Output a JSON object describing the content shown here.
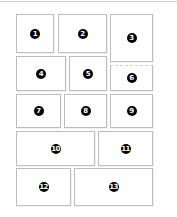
{
  "diagram": {
    "type": "numbered-grid-layout",
    "colors": {
      "border": "#bdbdbd",
      "badge": "#000000",
      "badge_text": "#ffffff",
      "background": "#ffffff"
    },
    "panels": [
      {
        "label": "1",
        "x": 16,
        "y": 14,
        "w": 38,
        "h": 39
      },
      {
        "label": "2",
        "x": 58,
        "y": 14,
        "w": 49,
        "h": 39
      },
      {
        "label": "3",
        "x": 110,
        "y": 14,
        "w": 43,
        "h": 48
      },
      {
        "label": "4",
        "x": 16,
        "y": 56,
        "w": 50,
        "h": 35
      },
      {
        "label": "5",
        "x": 69,
        "y": 56,
        "w": 38,
        "h": 35
      },
      {
        "label": "6",
        "x": 110,
        "y": 65,
        "w": 43,
        "h": 26
      },
      {
        "label": "7",
        "x": 16,
        "y": 94,
        "w": 45,
        "h": 34
      },
      {
        "label": "8",
        "x": 64,
        "y": 94,
        "w": 43,
        "h": 34
      },
      {
        "label": "9",
        "x": 110,
        "y": 94,
        "w": 43,
        "h": 34
      },
      {
        "label": "10",
        "x": 16,
        "y": 131,
        "w": 79,
        "h": 35
      },
      {
        "label": "11",
        "x": 98,
        "y": 131,
        "w": 55,
        "h": 35
      },
      {
        "label": "12",
        "x": 16,
        "y": 168,
        "w": 55,
        "h": 38
      },
      {
        "label": "13",
        "x": 74,
        "y": 168,
        "w": 79,
        "h": 38
      }
    ]
  }
}
